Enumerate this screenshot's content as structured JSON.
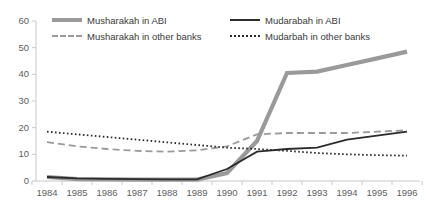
{
  "chart_data": {
    "type": "line",
    "title": "",
    "xlabel": "",
    "ylabel": "",
    "categories": [
      "1984",
      "1985",
      "1986",
      "1987",
      "1988",
      "1989",
      "1990",
      "1991",
      "1992",
      "1993",
      "1994",
      "1995",
      "1996"
    ],
    "ylim": [
      0,
      60
    ],
    "yticks": [
      "0",
      "10",
      "20",
      "30",
      "40",
      "50",
      "60"
    ],
    "grid": false,
    "legend_position": "top",
    "series": [
      {
        "name": "Musharakah in ABI",
        "style": "solid-thick",
        "color": "#9a9a9a",
        "values": [
          1.5,
          0.7,
          0.6,
          0.5,
          0.5,
          0.5,
          3.0,
          15.0,
          40.5,
          41.0,
          43.5,
          46.0,
          48.5
        ]
      },
      {
        "name": "Musharakah in other banks",
        "style": "dashed",
        "color": "#9a9a9a",
        "values": [
          14.6,
          13.0,
          12.0,
          11.3,
          11.0,
          11.5,
          13.0,
          17.5,
          18.0,
          18.0,
          18.0,
          18.5,
          19.0
        ]
      },
      {
        "name": "Mudarabah in ABI",
        "style": "solid",
        "color": "#2b2b2b",
        "values": [
          1.5,
          1.0,
          0.8,
          0.7,
          0.6,
          0.6,
          4.5,
          11.0,
          12.0,
          12.5,
          15.5,
          17.0,
          18.5
        ]
      },
      {
        "name": "Mudarbah in other banks",
        "style": "dotted",
        "color": "#2b2b2b",
        "values": [
          18.5,
          17.5,
          16.5,
          15.5,
          14.5,
          13.5,
          12.5,
          12.0,
          11.3,
          10.5,
          10.0,
          9.7,
          9.5
        ]
      }
    ]
  },
  "legend": {
    "entries": [
      {
        "label": "Musharakah in ABI"
      },
      {
        "label": "Mudarabah in ABI"
      },
      {
        "label": "Musharakah in other banks"
      },
      {
        "label": "Mudarbah in other banks"
      }
    ]
  }
}
